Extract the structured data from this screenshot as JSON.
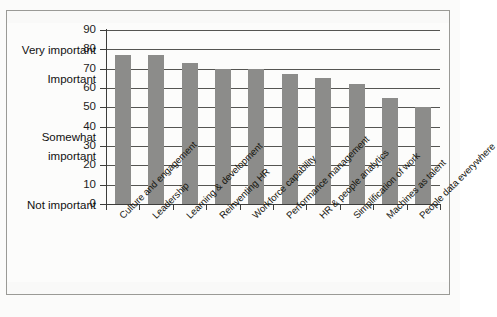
{
  "chart_data": {
    "type": "bar",
    "title": "",
    "xlabel": "",
    "ylabel": "",
    "ylim": [
      0,
      90
    ],
    "ytick_step": 10,
    "grid": true,
    "legend": "none",
    "orientation": "vertical",
    "bar_color": "#8c8c8a",
    "categories": [
      "Culture and engagement",
      "Leadership",
      "Learning & development",
      "Reinventing HR",
      "Workforce capability",
      "Performance management",
      "HR & people analytics",
      "Simplification of work",
      "Machines as talent",
      "People data everywhere"
    ],
    "values": [
      77,
      77,
      73,
      70,
      70,
      67,
      65,
      62,
      55,
      50
    ],
    "ytick_labels": [
      "0",
      "10",
      "20",
      "30",
      "40",
      "50",
      "60",
      "70",
      "80",
      "90"
    ],
    "y_category_labels": [
      {
        "text": "Very important",
        "value": 85
      },
      {
        "text": "Important",
        "value": 70
      },
      {
        "text": "Somewhat",
        "value": 40
      },
      {
        "text": "important",
        "value": 30
      },
      {
        "text": "Not important",
        "value": 0
      }
    ]
  },
  "axis": {
    "y_scale_labels": [
      "90",
      "80",
      "70",
      "60",
      "50",
      "40",
      "30",
      "20",
      "10",
      "0"
    ],
    "category_very_important": "Very important",
    "category_important": "Important",
    "category_somewhat_line1": "Somewhat",
    "category_somewhat_line2": "important",
    "category_not_important": "Not important"
  },
  "bars": [
    {
      "label": "Culture and engagement",
      "value": 77
    },
    {
      "label": "Leadership",
      "value": 77
    },
    {
      "label": "Learning & development",
      "value": 73
    },
    {
      "label": "Reinventing HR",
      "value": 70
    },
    {
      "label": "Workforce capability",
      "value": 70
    },
    {
      "label": "Performance management",
      "value": 67
    },
    {
      "label": "HR & people analytics",
      "value": 65
    },
    {
      "label": "Simplification of work",
      "value": 62
    },
    {
      "label": "Machines as talent",
      "value": 55
    },
    {
      "label": "People data everywhere",
      "value": 50
    }
  ],
  "colors": {
    "bar": "#8c8c8a",
    "gridline": "#555552",
    "axis": "#3d3d3b",
    "frame": "#9a9a96",
    "paper": "#fcfcfb",
    "text": "#111111"
  }
}
